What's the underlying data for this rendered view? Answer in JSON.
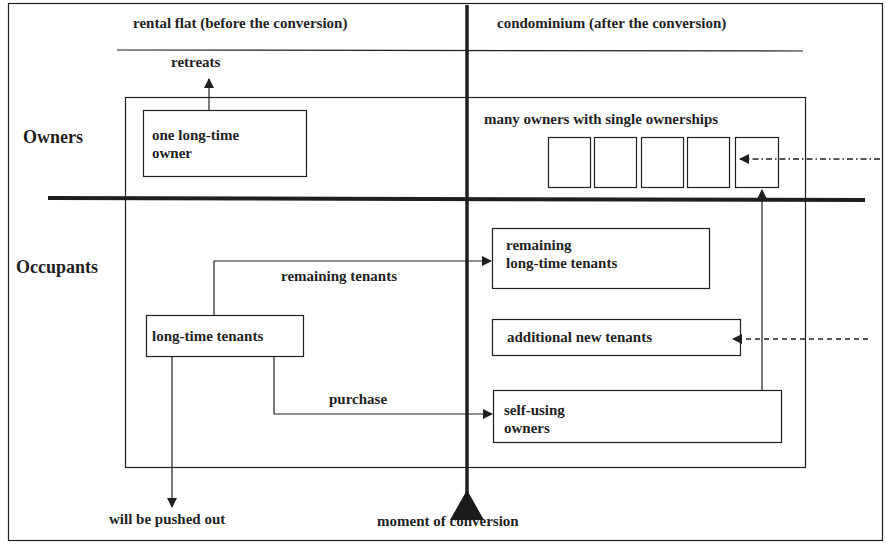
{
  "header": {
    "before_title": "rental flat (before the conversion)",
    "after_title": "condominium (after the conversion)"
  },
  "rows": {
    "owners": "Owners",
    "occupants": "Occupants"
  },
  "nodes": {
    "one_owner_line1": "one long-time",
    "one_owner_line2": "owner",
    "many_owners": "many owners with single ownerships",
    "long_time_tenants": "long-time tenants",
    "remaining_lt_line1": "remaining",
    "remaining_lt_line2": "long-time tenants",
    "additional_new_tenants": "additional new tenants",
    "self_using_line1": "self-using",
    "self_using_line2": "owners"
  },
  "edges": {
    "retreats": "retreats",
    "remaining_tenants": "remaining tenants",
    "purchase": "purchase",
    "pushed_out": "will be pushed out",
    "moment": "moment of conversion"
  },
  "ownership_units": 5,
  "colors": {
    "ink": "#1f1f1f",
    "background": "#ffffff"
  }
}
